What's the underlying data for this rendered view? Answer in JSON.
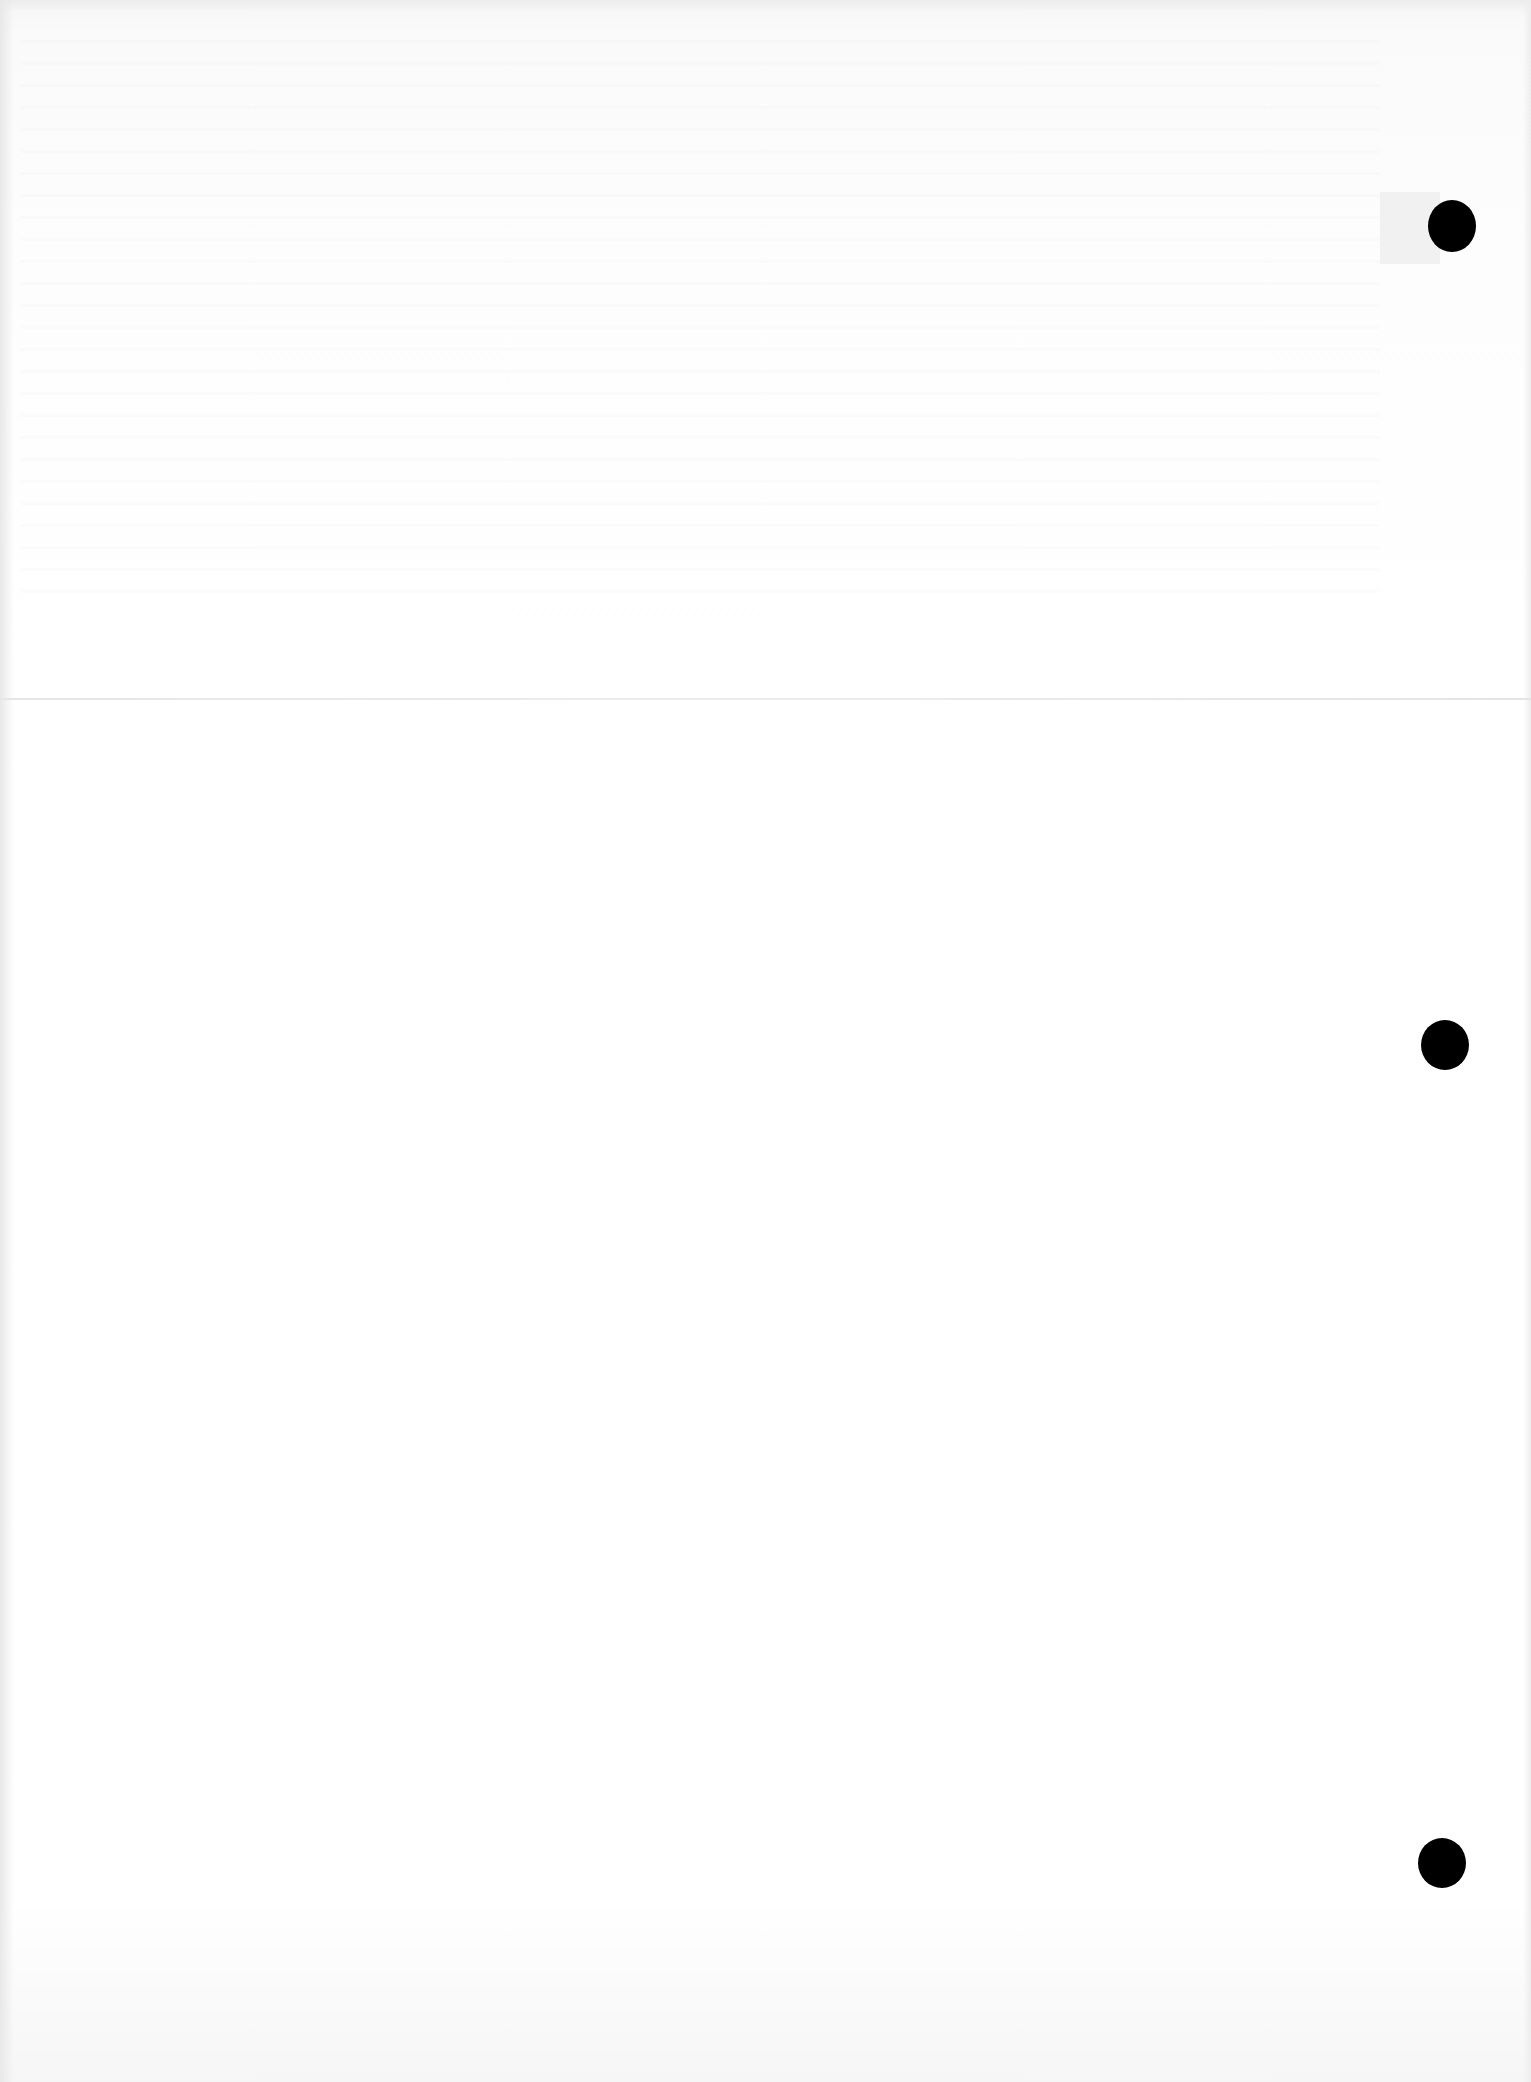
{
  "document": {
    "type": "scanned-blank-page",
    "text": "",
    "punch_holes": {
      "count": 3,
      "side": "right",
      "color": "#000000"
    },
    "fold_line": true,
    "background_color": "#ffffff"
  }
}
